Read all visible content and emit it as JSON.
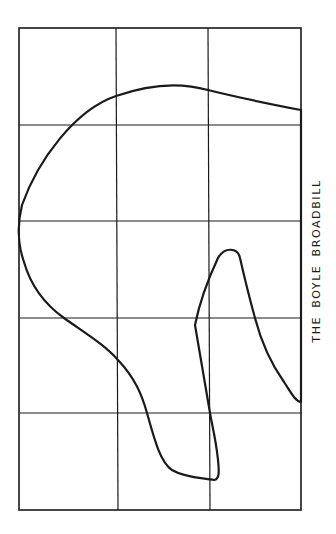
{
  "figure": {
    "caption": "THE BOYLE BROADBILL",
    "ink_color": "#1a1a1a",
    "background": "#ffffff",
    "grid": {
      "columns": 3,
      "rows": 5,
      "outer_box": {
        "left": 19,
        "top": 28,
        "right": 301,
        "bottom": 510
      },
      "vertical_lines_x": [
        117,
        209
      ],
      "horizontal_lines_y": [
        125,
        221,
        318,
        413
      ]
    },
    "outline_description": "Profile outline of a fishing lure / hull drawn over a 3x5 grid"
  }
}
